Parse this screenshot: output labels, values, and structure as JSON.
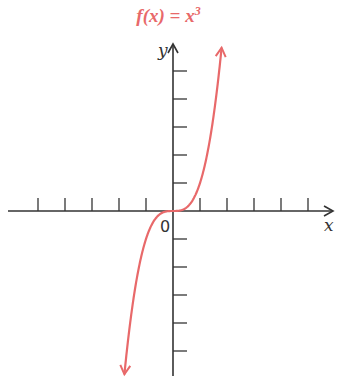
{
  "chart_data": {
    "type": "line",
    "title_parts": {
      "fx": "f(x) = x",
      "exp": "3"
    },
    "xlabel": "x",
    "ylabel": "y",
    "origin_label": "0",
    "function": "x^3",
    "x_range": [
      -1.8,
      1.8
    ],
    "xlim": [
      -6,
      6
    ],
    "ylim": [
      -6,
      6
    ],
    "x_ticks": [
      -5,
      -4,
      -3,
      -2,
      -1,
      1,
      2,
      3,
      4,
      5
    ],
    "y_ticks": [
      -5,
      -4,
      -3,
      -2,
      -1,
      1,
      2,
      3,
      4,
      5
    ],
    "tick_labels_shown": false,
    "grid": false,
    "legend": null,
    "curve_color": "#e8696a",
    "axis_color": "#333333",
    "arrows_on_curve_ends": true
  }
}
